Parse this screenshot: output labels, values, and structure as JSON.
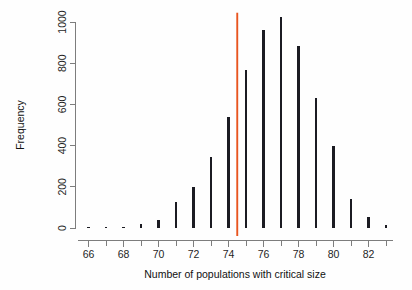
{
  "chart_data": {
    "type": "bar",
    "title": "",
    "subtitle": "",
    "xlabel": "Number of populations with critical size",
    "ylabel": "Frequency",
    "categories": [
      66,
      67,
      68,
      69,
      70,
      71,
      72,
      73,
      74,
      75,
      76,
      77,
      78,
      79,
      80,
      81,
      82,
      83
    ],
    "values": [
      5,
      4,
      7,
      20,
      40,
      125,
      200,
      345,
      540,
      765,
      960,
      1025,
      885,
      630,
      400,
      140,
      55,
      15
    ],
    "xlim": [
      65.4,
      83.4
    ],
    "ylim": [
      0,
      1045
    ],
    "xticks": [
      66,
      68,
      70,
      72,
      74,
      76,
      78,
      80,
      82
    ],
    "xtick_labels": [
      "66",
      "68",
      "70",
      "72",
      "74",
      "76",
      "78",
      "80",
      "82"
    ],
    "xticks_minor": [
      67,
      69,
      71,
      73,
      75,
      77,
      79,
      81,
      83
    ],
    "yticks": [
      0,
      200,
      400,
      600,
      800,
      1000
    ],
    "ytick_labels": [
      "0",
      "200",
      "400",
      "600",
      "800",
      "1000"
    ],
    "grid": false,
    "legend": null,
    "annotations": [
      {
        "name": "critical-threshold-line",
        "type": "vline",
        "x": 74.5,
        "y_top": 1045,
        "color": "#e8551f",
        "label": ""
      }
    ],
    "series_color": "#1b1b22",
    "background_color": "#fefefe",
    "axis_color": "#7d7d7d"
  }
}
